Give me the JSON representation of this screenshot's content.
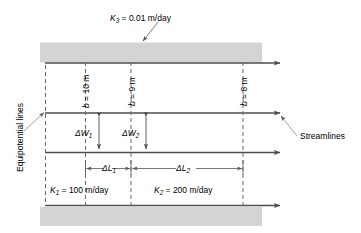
{
  "figure": {
    "name": "flow-net-refraction-diagram",
    "top_label": {
      "symbol": "K",
      "subscript": "3",
      "value": "= 0.01 m/day",
      "full": "K3 = 0.01 m/day"
    },
    "left_label": "Equipotential lines",
    "right_label": "Streamlines",
    "thickness_labels": [
      {
        "symbol": "b",
        "value": "= 10 m",
        "full": "b = 10 m"
      },
      {
        "symbol": "b",
        "value": "= 9 m",
        "full": "b = 9 m"
      },
      {
        "symbol": "b",
        "value": "= 8 m",
        "full": "b = 8 m"
      }
    ],
    "width_labels": [
      {
        "symbol": "ΔW",
        "subscript": "1",
        "full": "ΔW1"
      },
      {
        "symbol": "ΔW",
        "subscript": "2",
        "full": "ΔW2"
      }
    ],
    "length_labels": [
      {
        "symbol": "ΔL",
        "subscript": "1",
        "full": "ΔL1"
      },
      {
        "symbol": "ΔL",
        "subscript": "2",
        "full": "ΔL2"
      }
    ],
    "conductivity_labels": [
      {
        "symbol": "K",
        "subscript": "1",
        "value": "= 100 m/day",
        "full": "K1 = 100 m/day"
      },
      {
        "symbol": "K",
        "subscript": "2",
        "value": "= 200 m/day",
        "full": "K2 = 200 m/day"
      }
    ],
    "colors": {
      "confining_layer_fill": "#d4d4d4",
      "line": "#4d4d4d",
      "dashed": "#6b6b6b",
      "leader": "#8a8a8a",
      "text": "#000000"
    }
  }
}
